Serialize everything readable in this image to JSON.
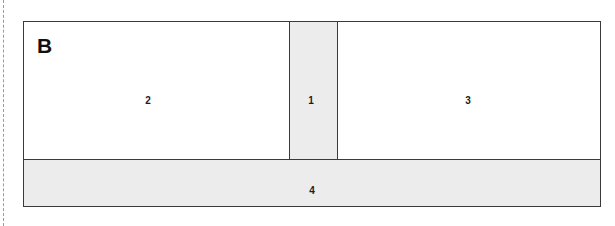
{
  "figure": {
    "panel_letter": "B",
    "background_color": "#ffffff",
    "outline_color": "#3a3a3a",
    "fill_gray": "#ececec",
    "fill_white": "#ffffff",
    "guide_color": "#9a9a9a"
  },
  "regions": [
    {
      "id": "1",
      "label": "1",
      "role": "center-column",
      "fill": "#ececec"
    },
    {
      "id": "2",
      "label": "2",
      "role": "left-field",
      "fill": "#ffffff"
    },
    {
      "id": "3",
      "label": "3",
      "role": "right-field",
      "fill": "#ffffff"
    },
    {
      "id": "4",
      "label": "4",
      "role": "base-bar",
      "fill": "#ececec"
    }
  ]
}
